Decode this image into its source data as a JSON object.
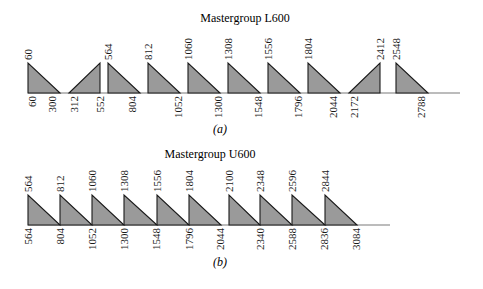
{
  "panels": [
    {
      "id": "a",
      "title": "Mastergroup L600",
      "caption": "(a)",
      "baseline_y": 93,
      "top_y": 63,
      "axis_x_start": 28,
      "axis_x_end": 460,
      "title_x": 245,
      "title_y": 22,
      "caption_x": 220,
      "caption_y": 133,
      "triangles": [
        {
          "x1": 28,
          "x2": 60,
          "dir": "down",
          "top_label": "60",
          "bottom_labels": [
            {
              "x": 36,
              "text": "60"
            },
            {
              "x": 56,
              "text": "300"
            }
          ]
        },
        {
          "x1": 69,
          "x2": 100,
          "dir": "up",
          "top_label": "2412_placeholder_hidden",
          "bottom_labels": [
            {
              "x": 78,
              "text": "312"
            },
            {
              "x": 104,
              "text": "552"
            }
          ]
        },
        {
          "x1": 108,
          "x2": 140,
          "dir": "down",
          "top_label": "564",
          "bottom_labels": [
            {
              "x": 136,
              "text": "804"
            }
          ]
        },
        {
          "x1": 148,
          "x2": 180,
          "dir": "down",
          "top_label": "812",
          "bottom_labels": [
            {
              "x": 182,
              "text": "1052"
            }
          ]
        },
        {
          "x1": 188,
          "x2": 220,
          "dir": "down",
          "top_label": "1060",
          "bottom_labels": [
            {
              "x": 222,
              "text": "1300"
            }
          ]
        },
        {
          "x1": 228,
          "x2": 260,
          "dir": "down",
          "top_label": "1308",
          "bottom_labels": [
            {
              "x": 262,
              "text": "1548"
            }
          ]
        },
        {
          "x1": 268,
          "x2": 300,
          "dir": "down",
          "top_label": "1556",
          "bottom_labels": [
            {
              "x": 302,
              "text": "1796"
            }
          ]
        },
        {
          "x1": 308,
          "x2": 340,
          "dir": "down",
          "top_label": "1804",
          "bottom_labels": [
            {
              "x": 337,
              "text": "2044"
            }
          ]
        },
        {
          "x1": 349,
          "x2": 380,
          "dir": "up",
          "top_label": "2412",
          "bottom_labels": [
            {
              "x": 358,
              "text": "2172"
            }
          ]
        },
        {
          "x1": 396,
          "x2": 428,
          "dir": "down",
          "top_label": "2548",
          "bottom_labels": [
            {
              "x": 425,
              "text": "2788"
            }
          ]
        }
      ]
    },
    {
      "id": "b",
      "title": "Mastergroup U600",
      "caption": "(b)",
      "baseline_y": 225,
      "top_y": 195,
      "axis_x_start": 28,
      "axis_x_end": 390,
      "title_x": 210,
      "title_y": 158,
      "caption_x": 220,
      "caption_y": 266,
      "triangles": [
        {
          "x1": 28,
          "x2": 60,
          "dir": "down",
          "top_label": "564",
          "bottom_labels": [
            {
              "x": 32,
              "text": "564"
            }
          ]
        },
        {
          "x1": 60,
          "x2": 92,
          "dir": "down",
          "top_label": "812",
          "bottom_labels": [
            {
              "x": 64,
              "text": "804"
            }
          ]
        },
        {
          "x1": 92,
          "x2": 124,
          "dir": "down",
          "top_label": "1060",
          "bottom_labels": [
            {
              "x": 96,
              "text": "1052"
            }
          ]
        },
        {
          "x1": 124,
          "x2": 157,
          "dir": "down",
          "top_label": "1308",
          "bottom_labels": [
            {
              "x": 128,
              "text": "1300"
            }
          ]
        },
        {
          "x1": 157,
          "x2": 189,
          "dir": "down",
          "top_label": "1556",
          "bottom_labels": [
            {
              "x": 160,
              "text": "1548"
            }
          ]
        },
        {
          "x1": 189,
          "x2": 221,
          "dir": "down",
          "top_label": "1804",
          "bottom_labels": [
            {
              "x": 193,
              "text": "1796"
            }
          ]
        },
        {
          "x1": 229,
          "x2": 260,
          "dir": "down",
          "top_label": "2100",
          "bottom_labels": [
            {
              "x": 224,
              "text": "2044"
            }
          ]
        },
        {
          "x1": 260,
          "x2": 292,
          "dir": "down",
          "top_label": "2348",
          "bottom_labels": [
            {
              "x": 264,
              "text": "2340"
            }
          ]
        },
        {
          "x1": 292,
          "x2": 325,
          "dir": "down",
          "top_label": "2596",
          "bottom_labels": [
            {
              "x": 296,
              "text": "2588"
            }
          ]
        },
        {
          "x1": 325,
          "x2": 357,
          "dir": "down",
          "top_label": "2844",
          "bottom_labels": [
            {
              "x": 328,
              "text": "2836"
            },
            {
              "x": 360,
              "text": "3084"
            }
          ]
        }
      ]
    }
  ],
  "colors": {
    "fill": "#9a9a9a",
    "stroke": "#1a1a1a",
    "axis": "#7a7a7a",
    "text": "#1a1a1a"
  }
}
